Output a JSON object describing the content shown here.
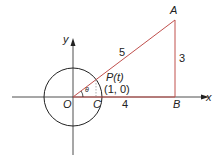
{
  "diagram": {
    "colors": {
      "axis": "#222222",
      "circle": "#222222",
      "triangle": "#c0504d",
      "dashed": "#888888"
    },
    "axes": {
      "x_label": "x",
      "y_label": "y"
    },
    "points": {
      "origin": "O",
      "c": "C",
      "b": "B",
      "a": "A",
      "p": "P(t)",
      "p_coord": "(1, 0)"
    },
    "angle_label": "θ",
    "segments": {
      "hypotenuse": "5",
      "vertical": "3",
      "base": "4"
    }
  }
}
